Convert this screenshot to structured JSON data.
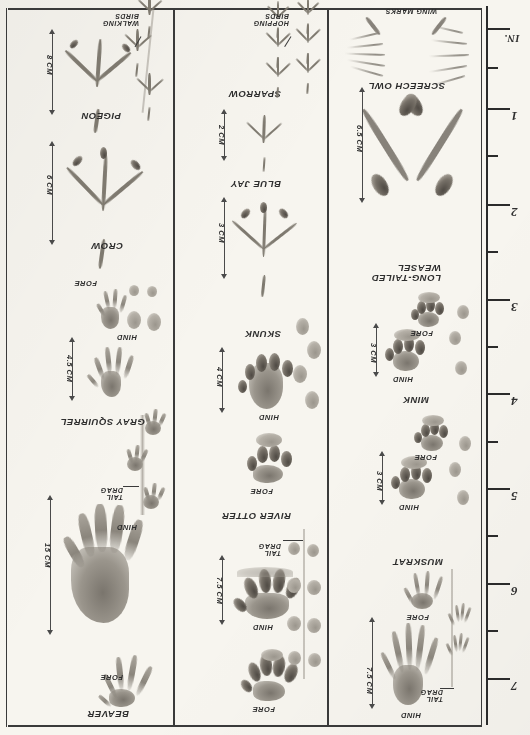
{
  "plate": {
    "title": "Animal Tracks Field Guide Plate",
    "orientation_note": "page photographed upside-down"
  },
  "ruler": {
    "unit_label": "IN.",
    "ticks": [
      "1",
      "2",
      "3",
      "4",
      "5",
      "6",
      "7"
    ]
  },
  "columns": [
    {
      "id": "column-1",
      "entries": [
        {
          "species": "SCREECH OWL",
          "parts": [],
          "dimension": "6.5 CM",
          "notes": [
            "WING MARKS"
          ]
        },
        {
          "species": "LONG-TAILED\nWEASEL",
          "parts": [
            "HIND",
            "FORE"
          ],
          "dimension": "3 CM",
          "notes": []
        },
        {
          "species": "MINK",
          "parts": [
            "HIND",
            "FORE"
          ],
          "dimension": "3 CM",
          "notes": []
        },
        {
          "species": "MUSKRAT",
          "parts": [
            "HIND",
            "FORE"
          ],
          "dimension": "7.5 CM",
          "notes": [
            "TAIL\nDRAG"
          ]
        }
      ]
    },
    {
      "id": "column-2",
      "entries": [
        {
          "species": "SPARROW",
          "parts": [],
          "dimension": "2 CM",
          "notes": [
            "HOPPING\nBIRDS"
          ]
        },
        {
          "species": "BLUE JAY",
          "parts": [],
          "dimension": "3 CM",
          "notes": []
        },
        {
          "species": "SKUNK",
          "parts": [
            "HIND",
            "FORE"
          ],
          "dimension": "4 CM",
          "notes": []
        },
        {
          "species": "RIVER OTTER",
          "parts": [
            "HIND",
            "FORE"
          ],
          "dimension": "7.5 CM",
          "notes": [
            "TAIL\nDRAG"
          ]
        }
      ]
    },
    {
      "id": "column-3",
      "entries": [
        {
          "species": "PIGEON",
          "parts": [],
          "dimension": "8 CM",
          "notes": [
            "WALKING\nBIRDS"
          ]
        },
        {
          "species": "CROW",
          "parts": [],
          "dimension": "6 CM",
          "notes": []
        },
        {
          "species": "GRAY SQUIRREL",
          "parts": [
            "FORE",
            "HIND"
          ],
          "dimension": "4.5 CM",
          "notes": []
        },
        {
          "species": "BEAVER",
          "parts": [
            "HIND",
            "FORE"
          ],
          "dimension": "15 CM",
          "notes": [
            "TAIL\nDRAG"
          ]
        }
      ]
    }
  ],
  "colors": {
    "paper": "#f7f5ef",
    "ink": "#2e2e2e",
    "pencil": "#8d887f"
  }
}
